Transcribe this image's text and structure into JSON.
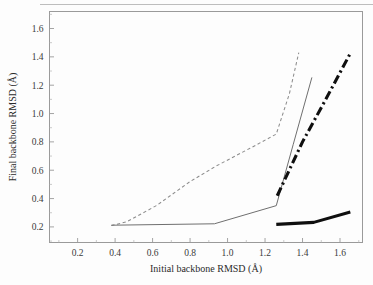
{
  "chart_data": {
    "type": "line",
    "title": "",
    "xlabel": "Initial backbone RMSD (Å)",
    "ylabel": "Final backbone RMSD (Å)",
    "xlim": [
      0.05,
      1.72
    ],
    "ylim": [
      0.09,
      1.72
    ],
    "xticks": [
      0.2,
      0.4,
      0.6,
      0.8,
      1.0,
      1.2,
      1.4,
      1.6
    ],
    "xtick_labels": [
      "0.2",
      "0.4",
      "0.6",
      "0.8",
      "1.0",
      "1.2",
      "1.4",
      "1.6"
    ],
    "yticks": [
      0.2,
      0.4,
      0.6,
      0.8,
      1.0,
      1.2,
      1.4,
      1.6
    ],
    "ytick_labels": [
      "0.2",
      "0.4",
      "0.6",
      "0.8",
      "1.0",
      "1.2",
      "1.4",
      "1.6"
    ],
    "minor_ticks": true,
    "grid": false,
    "legend": "none",
    "frame": "box",
    "series": [
      {
        "name": "thin-dashed",
        "style": "dashed",
        "width": "thin",
        "color": "#8c8c8c",
        "points": [
          [
            0.38,
            0.21
          ],
          [
            0.46,
            0.235
          ],
          [
            0.62,
            0.35
          ],
          [
            0.8,
            0.52
          ],
          [
            0.94,
            0.63
          ],
          [
            1.12,
            0.755
          ],
          [
            1.26,
            0.855
          ],
          [
            1.33,
            1.14
          ],
          [
            1.38,
            1.43
          ]
        ]
      },
      {
        "name": "thin-solid",
        "style": "solid",
        "width": "thin",
        "color": "#6f6f6f",
        "points": [
          [
            0.38,
            0.212
          ],
          [
            0.93,
            0.222
          ],
          [
            1.26,
            0.35
          ],
          [
            1.35,
            0.78
          ],
          [
            1.45,
            1.255
          ]
        ]
      },
      {
        "name": "thick-dash-dot",
        "style": "dash-dot",
        "width": "thick",
        "color": "#0f0f0f",
        "points": [
          [
            1.265,
            0.42
          ],
          [
            1.4,
            0.8
          ],
          [
            1.52,
            1.09
          ],
          [
            1.655,
            1.425
          ]
        ]
      },
      {
        "name": "thick-solid",
        "style": "solid",
        "width": "thick",
        "color": "#0f0f0f",
        "points": [
          [
            1.26,
            0.218
          ],
          [
            1.46,
            0.232
          ],
          [
            1.655,
            0.305
          ]
        ]
      }
    ]
  },
  "axes": {
    "x_title": "Initial backbone RMSD (Å)",
    "y_title": "Final backbone RMSD (Å)"
  }
}
